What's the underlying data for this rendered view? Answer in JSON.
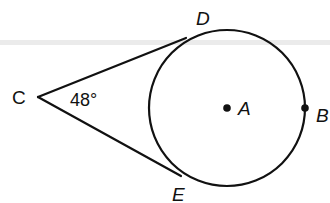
{
  "diagram": {
    "type": "geometry",
    "colors": {
      "stroke": "#111111",
      "background": "#ffffff",
      "band": "#e6e6e6"
    },
    "circle": {
      "center_label": "A",
      "cx": 227,
      "cy": 108,
      "r": 78
    },
    "points": {
      "C": {
        "label": "C",
        "x": 38,
        "y": 97
      },
      "D": {
        "label": "D",
        "x": 185,
        "y": 38
      },
      "E": {
        "label": "E",
        "x": 180,
        "y": 176
      },
      "A": {
        "label": "A",
        "x": 227,
        "y": 108
      },
      "B": {
        "label": "B",
        "x": 305,
        "y": 108
      }
    },
    "angle": {
      "vertex": "C",
      "label": "48°"
    }
  }
}
